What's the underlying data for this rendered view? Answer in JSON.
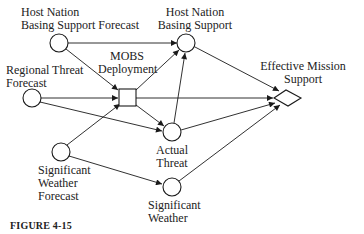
{
  "diagram": {
    "nodes": [
      {
        "id": "hnbs_forecast",
        "shape": "circle",
        "label_lines": [
          "Host Nation",
          "Basing Support Forecast"
        ]
      },
      {
        "id": "regional_threat_forecast",
        "shape": "circle",
        "label_lines": [
          "Regional Threat",
          "Forecast"
        ]
      },
      {
        "id": "mobs_deployment",
        "shape": "square",
        "label_lines": [
          "MOBS",
          "Deployment"
        ]
      },
      {
        "id": "hnbs",
        "shape": "circle",
        "label_lines": [
          "Host Nation",
          "Basing Support"
        ]
      },
      {
        "id": "actual_threat",
        "shape": "circle",
        "label_lines": [
          "Actual",
          "Threat"
        ]
      },
      {
        "id": "sig_weather_forecast",
        "shape": "circle",
        "label_lines": [
          "Significant",
          "Weather",
          "Forecast"
        ]
      },
      {
        "id": "sig_weather",
        "shape": "circle",
        "label_lines": [
          "Significant",
          "Weather"
        ]
      },
      {
        "id": "effective_mission_support",
        "shape": "diamond",
        "label_lines": [
          "Effective Mission",
          "Support"
        ]
      }
    ],
    "edges": [
      {
        "from": "hnbs_forecast",
        "to": "hnbs"
      },
      {
        "from": "hnbs_forecast",
        "to": "mobs_deployment"
      },
      {
        "from": "regional_threat_forecast",
        "to": "mobs_deployment"
      },
      {
        "from": "regional_threat_forecast",
        "to": "actual_threat"
      },
      {
        "from": "sig_weather_forecast",
        "to": "mobs_deployment"
      },
      {
        "from": "sig_weather_forecast",
        "to": "sig_weather"
      },
      {
        "from": "mobs_deployment",
        "to": "hnbs"
      },
      {
        "from": "mobs_deployment",
        "to": "actual_threat"
      },
      {
        "from": "mobs_deployment",
        "to": "effective_mission_support"
      },
      {
        "from": "actual_threat",
        "to": "hnbs"
      },
      {
        "from": "actual_threat",
        "to": "effective_mission_support"
      },
      {
        "from": "hnbs",
        "to": "effective_mission_support"
      },
      {
        "from": "sig_weather",
        "to": "effective_mission_support"
      }
    ]
  },
  "labels": {
    "hnbs_forecast": {
      "line1": "Host Nation",
      "line2": "Basing Support Forecast"
    },
    "regional_threat_forecast": {
      "line1": "Regional Threat",
      "line2": "Forecast"
    },
    "mobs_deployment": {
      "line1": "MOBS",
      "line2": "Deployment"
    },
    "hnbs": {
      "line1": "Host Nation",
      "line2": "Basing Support"
    },
    "actual_threat": {
      "line1": "Actual",
      "line2": "Threat"
    },
    "sig_weather_forecast": {
      "line1": "Significant",
      "line2": "Weather",
      "line3": "Forecast"
    },
    "sig_weather": {
      "line1": "Significant",
      "line2": "Weather"
    },
    "effective_mission_support": {
      "line1": "Effective Mission",
      "line2": "Support"
    }
  },
  "caption": "FIGURE 4-15",
  "colors": {
    "stroke": "#1a1a1a",
    "background": "#ffffff"
  }
}
